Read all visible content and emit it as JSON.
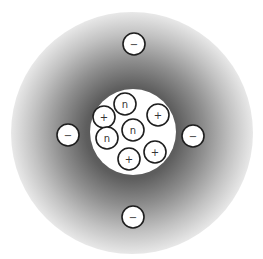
{
  "diagram": {
    "title": "",
    "cloud": {
      "cx": 132,
      "cy": 133,
      "r": 121,
      "inner_color": "#5a5a5a",
      "outer_color": "#e4e4e4"
    },
    "nucleus": {
      "cx": 133,
      "cy": 132,
      "r": 43,
      "color": "#ffffff"
    },
    "particle_radius": 11,
    "electrons": [
      {
        "cx": 134,
        "cy": 44,
        "symbol": "−"
      },
      {
        "cx": 68,
        "cy": 135,
        "symbol": "−"
      },
      {
        "cx": 193,
        "cy": 136,
        "symbol": "−"
      },
      {
        "cx": 133,
        "cy": 217,
        "symbol": "−"
      }
    ],
    "nucleons": [
      {
        "cx": 104,
        "cy": 117,
        "symbol": "+",
        "type": "proton"
      },
      {
        "cx": 125,
        "cy": 104,
        "symbol": "n",
        "type": "neutron"
      },
      {
        "cx": 158,
        "cy": 115,
        "symbol": "+",
        "type": "proton"
      },
      {
        "cx": 133,
        "cy": 130,
        "symbol": "n",
        "type": "neutron"
      },
      {
        "cx": 107,
        "cy": 138,
        "symbol": "n",
        "type": "neutron"
      },
      {
        "cx": 155,
        "cy": 152,
        "symbol": "+",
        "type": "proton"
      },
      {
        "cx": 129,
        "cy": 159,
        "symbol": "+",
        "type": "proton"
      }
    ]
  }
}
